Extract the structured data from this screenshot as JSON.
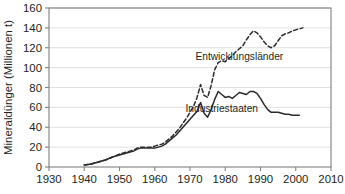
{
  "chart_data": {
    "type": "line",
    "title": "",
    "subtitle": "",
    "xlabel": "",
    "ylabel": "Mineraldünger (Millionen t)",
    "xlim": [
      1930,
      2010
    ],
    "ylim": [
      0,
      160
    ],
    "grid": true,
    "grid_axis": "y",
    "legend": "inline-annotations",
    "xticks": [
      1930,
      1940,
      1950,
      1960,
      1970,
      1980,
      1990,
      2000,
      2010
    ],
    "xtick_labels": [
      "1930",
      "1940",
      "1950",
      "1960",
      "1970",
      "1980",
      "1990",
      "2000",
      "2010"
    ],
    "yticks": [
      0,
      20,
      40,
      60,
      80,
      100,
      120,
      140,
      160
    ],
    "ytick_labels": [
      "0",
      "20",
      "40",
      "60",
      "80",
      "100",
      "120",
      "140",
      "160"
    ],
    "series": [
      {
        "name": "Entwicklungsländer",
        "style": "dashed",
        "color": "#2b2b2b",
        "label_x": 1984,
        "label_y": 108,
        "points": [
          [
            1940,
            2
          ],
          [
            1942,
            3
          ],
          [
            1944,
            5
          ],
          [
            1946,
            7
          ],
          [
            1948,
            10
          ],
          [
            1950,
            13
          ],
          [
            1952,
            15
          ],
          [
            1954,
            17
          ],
          [
            1955,
            19
          ],
          [
            1956,
            20
          ],
          [
            1957,
            20
          ],
          [
            1958,
            20
          ],
          [
            1959,
            20
          ],
          [
            1960,
            21
          ],
          [
            1961,
            22
          ],
          [
            1962,
            23
          ],
          [
            1963,
            25
          ],
          [
            1964,
            28
          ],
          [
            1965,
            31
          ],
          [
            1966,
            35
          ],
          [
            1967,
            39
          ],
          [
            1968,
            44
          ],
          [
            1969,
            49
          ],
          [
            1970,
            55
          ],
          [
            1971,
            61
          ],
          [
            1972,
            70
          ],
          [
            1973,
            83
          ],
          [
            1974,
            72
          ],
          [
            1975,
            70
          ],
          [
            1976,
            82
          ],
          [
            1977,
            98
          ],
          [
            1978,
            105
          ],
          [
            1979,
            107
          ],
          [
            1980,
            106
          ],
          [
            1981,
            109
          ],
          [
            1982,
            112
          ],
          [
            1983,
            116
          ],
          [
            1984,
            119
          ],
          [
            1985,
            122
          ],
          [
            1986,
            128
          ],
          [
            1987,
            133
          ],
          [
            1988,
            137
          ],
          [
            1989,
            135
          ],
          [
            1990,
            131
          ],
          [
            1991,
            126
          ],
          [
            1992,
            122
          ],
          [
            1993,
            120
          ],
          [
            1994,
            122
          ],
          [
            1995,
            127
          ],
          [
            1996,
            132
          ],
          [
            1997,
            134
          ],
          [
            1998,
            135
          ],
          [
            1999,
            137
          ],
          [
            2000,
            138
          ],
          [
            2001,
            139
          ],
          [
            2002,
            140
          ]
        ]
      },
      {
        "name": "Industriestaaten",
        "style": "solid",
        "color": "#2b2b2b",
        "label_x": 1979,
        "label_y": 55,
        "points": [
          [
            1940,
            2
          ],
          [
            1942,
            3
          ],
          [
            1944,
            5
          ],
          [
            1946,
            7
          ],
          [
            1948,
            10
          ],
          [
            1950,
            12
          ],
          [
            1952,
            14
          ],
          [
            1954,
            16
          ],
          [
            1955,
            18
          ],
          [
            1956,
            19
          ],
          [
            1957,
            19
          ],
          [
            1958,
            19
          ],
          [
            1959,
            19
          ],
          [
            1960,
            19
          ],
          [
            1961,
            20
          ],
          [
            1962,
            21
          ],
          [
            1963,
            23
          ],
          [
            1964,
            26
          ],
          [
            1965,
            29
          ],
          [
            1966,
            32
          ],
          [
            1967,
            36
          ],
          [
            1968,
            40
          ],
          [
            1969,
            44
          ],
          [
            1970,
            48
          ],
          [
            1971,
            52
          ],
          [
            1972,
            56
          ],
          [
            1973,
            65
          ],
          [
            1974,
            54
          ],
          [
            1975,
            50
          ],
          [
            1976,
            58
          ],
          [
            1977,
            68
          ],
          [
            1978,
            76
          ],
          [
            1979,
            73
          ],
          [
            1980,
            70
          ],
          [
            1981,
            71
          ],
          [
            1982,
            69
          ],
          [
            1983,
            72
          ],
          [
            1984,
            75
          ],
          [
            1985,
            74
          ],
          [
            1986,
            73
          ],
          [
            1987,
            76
          ],
          [
            1988,
            76
          ],
          [
            1989,
            74
          ],
          [
            1990,
            69
          ],
          [
            1991,
            63
          ],
          [
            1992,
            58
          ],
          [
            1993,
            55
          ],
          [
            1994,
            55
          ],
          [
            1995,
            55
          ],
          [
            1996,
            54
          ],
          [
            1997,
            53
          ],
          [
            1998,
            53
          ],
          [
            1999,
            52
          ],
          [
            2000,
            52
          ],
          [
            2001,
            52
          ]
        ]
      }
    ]
  }
}
